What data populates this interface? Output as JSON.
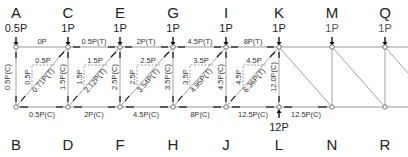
{
  "diagram": {
    "type": "truss-method-of-joints",
    "top_nodes": [
      {
        "id": "A",
        "load": "0.5P"
      },
      {
        "id": "C",
        "load": "1P"
      },
      {
        "id": "E",
        "load": "1P"
      },
      {
        "id": "G",
        "load": "1P"
      },
      {
        "id": "I",
        "load": "1P"
      },
      {
        "id": "K",
        "load": "1P"
      },
      {
        "id": "M",
        "load": "1P"
      },
      {
        "id": "Q",
        "load": "1P"
      }
    ],
    "bottom_nodes": [
      {
        "id": "B"
      },
      {
        "id": "D"
      },
      {
        "id": "F"
      },
      {
        "id": "H"
      },
      {
        "id": "J"
      },
      {
        "id": "L"
      },
      {
        "id": "N"
      },
      {
        "id": "R"
      }
    ],
    "support_reaction": {
      "node": "L",
      "value": "12P"
    },
    "top_chord_forces": [
      "0P",
      "0.5P(T)",
      "2P(T)",
      "4.5P(T)",
      "8P(T)"
    ],
    "bottom_chord_forces": [
      "0.5P(C)",
      "2P(C)",
      "4.5P(C)",
      "8P(C)",
      "12.5P(C)",
      "12.5P(C)"
    ],
    "vertical_forces": [
      "0.5P(C)",
      "1.5P(C)",
      "2.5P(C)",
      "3.5P(C)",
      "4.5P(C)",
      "12.0P(C)"
    ],
    "diagonal_forces": [
      "0.71P(T)",
      "2.12P(T)",
      "3.54P(T)",
      "4.95P(T)",
      "6.36P(T)"
    ],
    "component_labels": [
      {
        "horizontal": "0.5P",
        "vertical": "0.5P"
      },
      {
        "horizontal": "1.5P",
        "vertical": "1.5P"
      },
      {
        "horizontal": "2.5P",
        "vertical": "2.5P"
      },
      {
        "horizontal": "3.5P",
        "vertical": "3.5P"
      },
      {
        "horizontal": "4.5P",
        "vertical": "4.5P"
      }
    ]
  }
}
